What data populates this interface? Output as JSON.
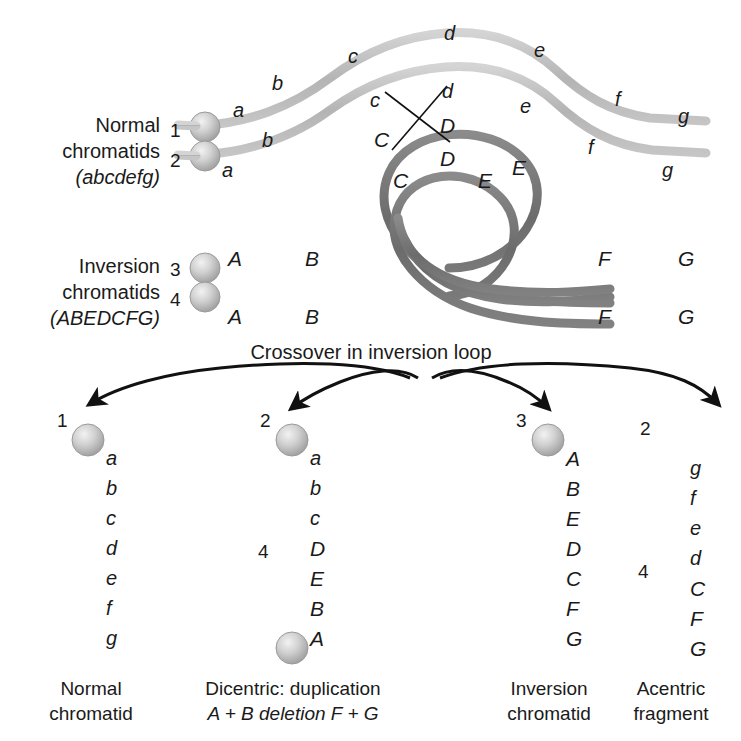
{
  "figure": {
    "title_caption": "Crossover in inversion loop",
    "colors": {
      "light_chromatid": "#b9b9b9",
      "light_chromatid_edge": "#cfcfcf",
      "dark_chromatid": "#6f6f6f",
      "dark_chromatid_edge": "#8a8a8a",
      "centromere": "#c8c8c8",
      "line": "#111111",
      "text": "#1a1a1a",
      "background": "#ffffff"
    }
  },
  "normal_block": {
    "caption_line1": "Normal",
    "caption_line2": "chromatids",
    "caption_line3": "(abcdefg)",
    "chromatid_numbers": [
      "1",
      "2"
    ],
    "chromatid_1_genes": [
      "a",
      "b",
      "c",
      "d",
      "e",
      "f",
      "g"
    ],
    "chromatid_2_genes": [
      "a",
      "b",
      "c",
      "d",
      "e",
      "f",
      "g"
    ]
  },
  "inversion_block": {
    "caption_line1": "Inversion",
    "caption_line2": "chromatids",
    "caption_line3": "(ABEDCFG)",
    "chromatid_numbers": [
      "3",
      "4"
    ],
    "loop_genes_upper": [
      "C",
      "D",
      "E"
    ],
    "loop_genes_lower": [
      "C",
      "D",
      "E"
    ],
    "chromatid_3_genes": [
      "A",
      "B",
      "F",
      "G"
    ],
    "chromatid_4_genes": [
      "A",
      "B",
      "F",
      "G"
    ]
  },
  "products": [
    {
      "number": "1",
      "second_number": "",
      "genes": [
        "a",
        "b",
        "c",
        "d",
        "e",
        "f",
        "g"
      ],
      "caption_line1": "Normal",
      "caption_line2": "chromatid",
      "caption_line2_italic": ""
    },
    {
      "number": "2",
      "second_number": "4",
      "genes": [
        "a",
        "b",
        "c",
        "D",
        "E",
        "B",
        "A"
      ],
      "caption_line1": "Dicentric: duplication",
      "caption_line2": "A + B deletion F + G",
      "caption_line2_italic": "yes"
    },
    {
      "number": "3",
      "second_number": "",
      "genes": [
        "A",
        "B",
        "E",
        "D",
        "C",
        "F",
        "G"
      ],
      "caption_line1": "Inversion",
      "caption_line2": "chromatid",
      "caption_line2_italic": ""
    },
    {
      "number": "2",
      "second_number": "4",
      "genes": [
        "g",
        "f",
        "e",
        "d",
        "C",
        "F",
        "G"
      ],
      "caption_line1": "Acentric",
      "caption_line2": "fragment",
      "caption_line2_italic": ""
    }
  ],
  "top_labels": {
    "c1_a": "a",
    "c1_b": "b",
    "c1_c": "c",
    "c1_d": "d",
    "c1_e": "e",
    "c1_f": "f",
    "c1_g": "g",
    "c2_a": "a",
    "c2_b": "b",
    "c2_c": "c",
    "c2_d": "d",
    "c2_e": "e",
    "c2_f": "f",
    "c2_g": "g"
  },
  "inv_labels": {
    "c3_A": "A",
    "c3_B": "B",
    "c3_F": "F",
    "c3_G": "G",
    "c4_A": "A",
    "c4_B": "B",
    "c4_F": "F",
    "c4_G": "G",
    "loop_C_outer": "C",
    "loop_D_outer": "D",
    "loop_E_outer": "E",
    "loop_C_inner": "C",
    "loop_D_inner": "D",
    "loop_E_inner": "E"
  },
  "product_numbers": {
    "p1": "1",
    "p2": "2",
    "p2b": "4",
    "p3": "3",
    "p4": "2",
    "p4b": "4"
  }
}
